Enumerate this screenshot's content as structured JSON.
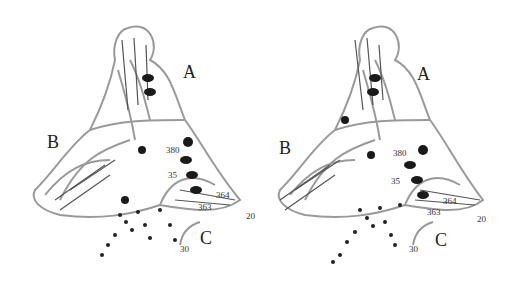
{
  "figure": {
    "type": "stereo protein ribbon diagram",
    "panels": [
      {
        "side": "left",
        "domain_labels": [
          "A",
          "B",
          "C"
        ],
        "residue_labels": [
          "380",
          "35",
          "364",
          "363",
          "20",
          "30"
        ]
      },
      {
        "side": "right",
        "domain_labels": [
          "A",
          "B",
          "C"
        ],
        "residue_labels": [
          "380",
          "35",
          "364",
          "363",
          "20",
          "30"
        ]
      }
    ],
    "colors": {
      "ribbon": "#9a9a9a",
      "helix_dark": "#1a1a1a",
      "ligand": "#222222",
      "background": "#ffffff"
    }
  }
}
